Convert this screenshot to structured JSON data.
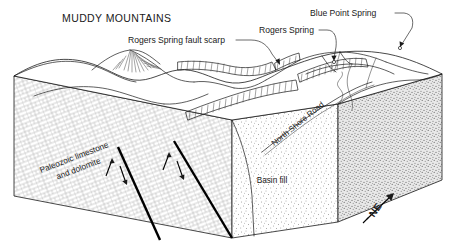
{
  "figure": {
    "kind": "geologic-block-diagram",
    "title": "MUDDY MOUNTAINS",
    "background_color": "#ffffff",
    "ink_color": "#1a1a1a"
  },
  "annotations": [
    {
      "id": "rogers-spring-fault-scarp",
      "label": "Rogers Spring fault scarp",
      "text_x": 128,
      "text_y": 43,
      "anchor": "start",
      "leader": "M 236,40 L 251,40 C 262,40 268,46 272,54 L 278,62",
      "arrow_x": 279,
      "arrow_y": 64,
      "arrow_angle": 58
    },
    {
      "id": "rogers-spring",
      "label": "Rogers Spring",
      "text_x": 259,
      "text_y": 33,
      "anchor": "start",
      "leader": "M 319,30 L 327,30 C 335,30 337,38 336,47 L 334,58",
      "arrow_x": 334,
      "arrow_y": 60,
      "arrow_angle": 100
    },
    {
      "id": "blue-point-spring",
      "label": "Blue Point Spring",
      "text_x": 310,
      "text_y": 16,
      "anchor": "start",
      "leader": "M 395,13 L 404,13 C 412,14 414,20 412,28 L 402,44",
      "arrow_x": 400,
      "arrow_y": 46,
      "arrow_angle": 122
    }
  ],
  "units": [
    {
      "id": "paleozoic-limestone-dolomite",
      "line1": "Paleozoic limestone",
      "line2": "and dolomite",
      "x": 75,
      "y": 160,
      "rotation": -21,
      "texture": "brick-masonry"
    },
    {
      "id": "basin-fill",
      "line1": "Basin fill",
      "line2": "",
      "x": 272,
      "y": 183,
      "rotation": 0,
      "texture": "stipple"
    }
  ],
  "road": {
    "id": "north-shore-road",
    "label": "North Shore Road",
    "path_id": "roadTextPath",
    "offset": "4%"
  },
  "compass": {
    "label": "NE",
    "text_x": 378,
    "text_y": 212,
    "rotation": -55,
    "shaft": "M 367,219 L 392,195",
    "head_x": 393,
    "head_y": 194
  },
  "faults": [
    {
      "id": "fault-west",
      "path": "M 118,147 L 160,240",
      "slip_up": "M 103,174 L 110,158",
      "slip_down": "M 117,165 L 124,182"
    },
    {
      "id": "fault-east",
      "path": "M 174,141 L 232,238",
      "slip_up": "M 161,168 L 168,152",
      "slip_down": "M 175,160 L 182,177"
    }
  ]
}
